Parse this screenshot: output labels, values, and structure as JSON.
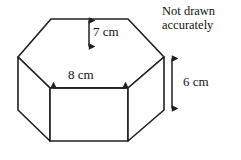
{
  "figure": {
    "name": "hexagonal-prism-diagram",
    "shape": "hexagonal prism",
    "stroke_color": "#231f20",
    "fill_color": "#ffffff",
    "note": {
      "line1": "Not drawn",
      "line2": "accurately"
    },
    "dimensions": [
      {
        "id": "depth",
        "label": "7 cm",
        "value": 7,
        "unit": "cm",
        "orientation": "vertical",
        "description": "distance from top back edge to front top edge of hexagonal face"
      },
      {
        "id": "width",
        "label": "8 cm",
        "value": 8,
        "unit": "cm",
        "orientation": "horizontal",
        "description": "width of front rectangular face of prism"
      },
      {
        "id": "height",
        "label": "6 cm",
        "value": 6,
        "unit": "cm",
        "orientation": "vertical",
        "description": "height of prism measured at right side vertical edge"
      }
    ]
  }
}
